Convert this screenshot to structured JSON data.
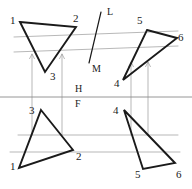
{
  "drawing": {
    "title": "Two-view orthographic projection of two triangles",
    "ink_color": "#1a1a1a",
    "construction_color": "#9a9a9a",
    "reference_line_color": "#8a8a8a",
    "background_color": "#ffffff",
    "stroke_width_object": 1.9,
    "stroke_width_construction": 0.7,
    "stroke_width_reference": 0.9
  },
  "reference_lines": {
    "hf_line": {
      "x1": 0,
      "y1": 97,
      "x2": 192,
      "y2": 97
    },
    "label_h": {
      "text": "H",
      "x": 75,
      "y": 92
    },
    "label_f": {
      "text": "F",
      "x": 75,
      "y": 107
    }
  },
  "cutting_plane": {
    "line": {
      "x1": 101,
      "y1": 12,
      "x2": 89,
      "y2": 63
    },
    "label_top": {
      "text": "L",
      "x": 107,
      "y": 15
    },
    "label_bottom": {
      "text": "M",
      "x": 92,
      "y": 72
    }
  },
  "top_view": {
    "triangle_a": {
      "name": "triangle-123-top",
      "points": "20,22 76,27 45,72",
      "vertices": [
        {
          "id": "1",
          "label": "1",
          "x": 20,
          "y": 22,
          "label_x": 10,
          "label_y": 24
        },
        {
          "id": "2",
          "label": "2",
          "x": 76,
          "y": 27,
          "label_x": 73,
          "label_y": 22
        },
        {
          "id": "3",
          "label": "3",
          "x": 45,
          "y": 72,
          "label_x": 50,
          "label_y": 80
        }
      ]
    },
    "triangle_b": {
      "name": "triangle-456-top",
      "points": "147,30 177,38 123,80",
      "vertices": [
        {
          "id": "5",
          "label": "5",
          "x": 147,
          "y": 30,
          "label_x": 137,
          "label_y": 24
        },
        {
          "id": "6",
          "label": "6",
          "x": 177,
          "y": 38,
          "label_x": 178,
          "label_y": 41
        },
        {
          "id": "4",
          "label": "4",
          "x": 123,
          "y": 80,
          "label_x": 114,
          "label_y": 87
        }
      ]
    }
  },
  "front_view": {
    "triangle_a": {
      "name": "triangle-123-front",
      "points": "41,110 73,150 19,168",
      "vertices": [
        {
          "id": "3",
          "label": "3",
          "x": 41,
          "y": 110,
          "label_x": 29,
          "label_y": 114
        },
        {
          "id": "2",
          "label": "2",
          "x": 73,
          "y": 150,
          "label_x": 76,
          "label_y": 160
        },
        {
          "id": "1",
          "label": "1",
          "x": 19,
          "y": 168,
          "label_x": 10,
          "label_y": 170
        }
      ]
    },
    "triangle_b": {
      "name": "triangle-456-front",
      "points": "124,110 143,169 175,163",
      "vertices": [
        {
          "id": "4",
          "label": "4",
          "x": 124,
          "y": 110,
          "label_x": 113,
          "label_y": 114
        },
        {
          "id": "5",
          "label": "5",
          "x": 143,
          "y": 169,
          "label_x": 135,
          "label_y": 178
        },
        {
          "id": "6",
          "label": "6",
          "x": 175,
          "y": 163,
          "label_x": 176,
          "label_y": 178
        }
      ]
    }
  },
  "construction": {
    "top_horizontals": [
      {
        "name": "top-horizontal-upper",
        "x1": 14,
        "y1": 37,
        "x2": 178,
        "y2": 31
      },
      {
        "name": "top-horizontal-lower",
        "x1": 14,
        "y1": 52,
        "x2": 178,
        "y2": 46
      }
    ],
    "bottom_horizontals": [
      {
        "name": "bottom-horizontal-upper",
        "x1": 18,
        "y1": 135,
        "x2": 178,
        "y2": 135
      },
      {
        "name": "bottom-horizontal-lower",
        "x1": 10,
        "y1": 152,
        "x2": 180,
        "y2": 152
      }
    ],
    "projectors": [
      {
        "name": "projector-vertex-1",
        "x": 32,
        "y_top": 54,
        "y_bottom": 135
      },
      {
        "name": "projector-vertex-3",
        "x": 62,
        "y_top": 54,
        "y_bottom": 135
      },
      {
        "name": "projector-vertex-4",
        "x": 131,
        "y_top": 62,
        "y_bottom": 135
      },
      {
        "name": "projector-vertex-6",
        "x": 148,
        "y_top": 62,
        "y_bottom": 135
      }
    ]
  }
}
